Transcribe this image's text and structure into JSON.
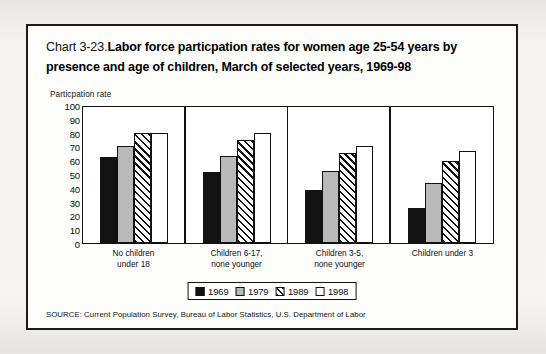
{
  "card": {
    "title_prefix": "Chart 3-23.",
    "title_main": "Labor force particpation rates for women age 25-54 years by presence and age of children, March of selected years, 1969-98",
    "source": "SOURCE: Current Population Survey, Bureau of Labor Statistics, U.S. Department of Labor"
  },
  "chart_data": {
    "type": "bar",
    "ylabel": "Particpation rate",
    "xlabel": "",
    "ylim": [
      0,
      100
    ],
    "yticks": [
      0,
      10,
      20,
      30,
      40,
      50,
      60,
      70,
      80,
      90,
      100
    ],
    "ytick_labels": [
      "0",
      "10",
      "20",
      "30",
      "40",
      "50",
      "60",
      "70",
      "80",
      "90",
      "100"
    ],
    "grid": false,
    "legend_position": "bottom-center",
    "categories": [
      "No children under 18",
      "Children 6-17, none younger",
      "Children 3-5, none younger",
      "Children under 3"
    ],
    "category_lines": [
      [
        "No children",
        "under 18"
      ],
      [
        "Children 6-17,",
        "none younger"
      ],
      [
        "Children 3-5,",
        "none younger"
      ],
      [
        "Children under 3"
      ]
    ],
    "series": [
      {
        "name": "1969",
        "fill": "solid-black",
        "color": "#121212",
        "values": [
          63,
          52,
          39,
          26
        ]
      },
      {
        "name": "1979",
        "fill": "solid-gray",
        "color": "#b9b9b9",
        "values": [
          71,
          64,
          53,
          44
        ]
      },
      {
        "name": "1989",
        "fill": "diagonal-hatch",
        "color": "#111111",
        "values": [
          81,
          76,
          66,
          60
        ]
      },
      {
        "name": "1998",
        "fill": "solid-white",
        "color": "#ffffff",
        "values": [
          81,
          81,
          71,
          68
        ]
      }
    ]
  }
}
